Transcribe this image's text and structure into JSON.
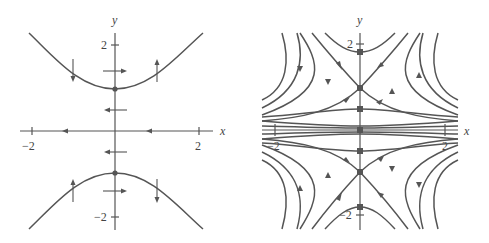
{
  "figure": {
    "left": {
      "title": "",
      "x_axis_label": "x",
      "y_axis_label": "y",
      "x_ticks": [
        {
          "value": -2,
          "label": "−2"
        },
        {
          "value": 2,
          "label": "2"
        }
      ],
      "y_ticks": [
        {
          "value": 2,
          "label": "2"
        },
        {
          "value": -2,
          "label": "−2"
        }
      ],
      "nullclines": [
        "y = sqrt(1 + x^2)",
        "y = -sqrt(1 + x^2)"
      ],
      "equilibria": [
        {
          "x": 0,
          "y": 1
        },
        {
          "x": 0,
          "y": -1
        }
      ]
    },
    "right": {
      "title": "",
      "x_axis_label": "x",
      "y_axis_label": "y",
      "x_ticks": [
        {
          "value": -2,
          "label": "−2"
        },
        {
          "value": 2,
          "label": "2"
        }
      ],
      "y_ticks": [
        {
          "value": 2,
          "label": "2"
        },
        {
          "value": -2,
          "label": "−2"
        }
      ],
      "equilibria": [
        {
          "x": 0,
          "y": 1
        },
        {
          "x": 0,
          "y": -1
        }
      ],
      "description": "phase portrait with saddle points at (0, 1) and (0, -1)"
    },
    "colors": {
      "ink": "#555555",
      "background": "#ffffff"
    }
  }
}
